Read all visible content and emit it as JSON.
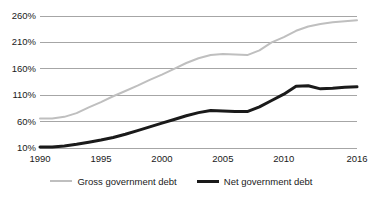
{
  "chart_data": {
    "type": "line",
    "title": "",
    "subtitle": "",
    "xlabel": "",
    "ylabel": "",
    "xlim": [
      1990,
      2016
    ],
    "ylim": [
      10,
      260
    ],
    "grid": "horizontal",
    "legend_position": "bottom",
    "y_ticks": [
      "10%",
      "60%",
      "110%",
      "160%",
      "210%",
      "260%"
    ],
    "y_tick_values": [
      10,
      60,
      110,
      160,
      210,
      260
    ],
    "x_ticks": [
      "1990",
      "1995",
      "2000",
      "2005",
      "2010",
      "2016"
    ],
    "x_tick_values": [
      1990,
      1995,
      2000,
      2005,
      2010,
      2016
    ],
    "x": [
      1990,
      1991,
      1992,
      1993,
      1994,
      1995,
      1996,
      1997,
      1998,
      1999,
      2000,
      2001,
      2002,
      2003,
      2004,
      2005,
      2006,
      2007,
      2008,
      2009,
      2010,
      2011,
      2012,
      2013,
      2014,
      2015,
      2016
    ],
    "series": [
      {
        "name": "Gross government debt",
        "color": "#bfbfbf",
        "width": 2,
        "values": [
          66,
          66,
          69,
          76,
          87,
          97,
          108,
          118,
          128,
          139,
          149,
          160,
          171,
          180,
          186,
          188,
          187,
          186,
          195,
          210,
          220,
          232,
          240,
          245,
          248,
          250,
          252
        ]
      },
      {
        "name": "Net government debt",
        "color": "#1a1a1a",
        "width": 3,
        "values": [
          12,
          12,
          14,
          17,
          21,
          25,
          30,
          36,
          43,
          50,
          57,
          64,
          71,
          77,
          81,
          80,
          79,
          79,
          88,
          100,
          112,
          127,
          128,
          122,
          123,
          125,
          126
        ]
      }
    ]
  },
  "legend": {
    "entries": [
      {
        "label": "Gross government debt",
        "swatch": "line-gray-icon"
      },
      {
        "label": "Net government debt",
        "swatch": "line-black-icon"
      }
    ]
  }
}
